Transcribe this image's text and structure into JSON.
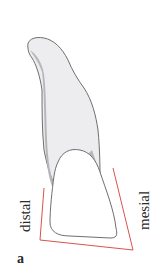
{
  "figure": {
    "panel_label": "a",
    "labels": {
      "distal": "distal",
      "mesial": "mesial"
    },
    "colors": {
      "outline": "#6f6f6f",
      "root_fill": "#ededf0",
      "shadow_fill": "#b7b7b9",
      "crown_fill": "#ffffff",
      "reference_line": "#d9534f"
    }
  }
}
